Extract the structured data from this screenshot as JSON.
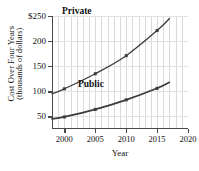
{
  "chart_data": {
    "type": "line",
    "title": "",
    "xlabel": "Year",
    "ylabel_line1": "Cost Over Four Years",
    "ylabel_line2": "(thousands of dollars)",
    "xlim": [
      1998,
      2020
    ],
    "ylim": [
      25,
      250
    ],
    "xticks": [
      2000,
      2005,
      2010,
      2015,
      2020
    ],
    "xticklabels": [
      "2000",
      "2005",
      "2010",
      "2015",
      "2020"
    ],
    "yticks": [
      50,
      100,
      150,
      200,
      250
    ],
    "yticklabels": [
      "50",
      "100",
      "150",
      "200",
      "$250"
    ],
    "grid": "vertical gridlines each year; horizontal gridlines at 50-unit intervals",
    "legend_position": "inline annotations next to curves",
    "line_color": "#3b3b3b",
    "grid_color": "#d9d9de",
    "axis_color": "#4a4a4a",
    "series": [
      {
        "name": "Private",
        "label": "Private",
        "x": [
          1998,
          2000,
          2005,
          2010,
          2015,
          2017
        ],
        "values": [
          95,
          105,
          135,
          171,
          221,
          245
        ],
        "marker_years": [
          2000,
          2005,
          2010,
          2015
        ]
      },
      {
        "name": "Public",
        "label": "Public",
        "x": [
          1998,
          2000,
          2005,
          2010,
          2015,
          2017
        ],
        "values": [
          45,
          49,
          64,
          83,
          106,
          118
        ],
        "marker_years": [
          2000,
          2005,
          2010,
          2015
        ]
      }
    ]
  }
}
